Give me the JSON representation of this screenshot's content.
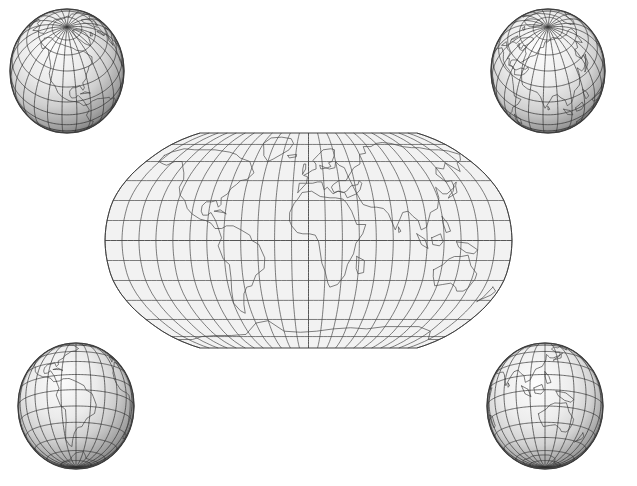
{
  "figure": {
    "background_color": "#ffffff",
    "width": 637,
    "height": 486
  },
  "style": {
    "graticule_color": "#3a3a3a",
    "coastline_color": "#4a4a4a",
    "outline_color": "#2e2e2e",
    "ocean_fill": "#f2f2f2",
    "globe_light": "#fbfbfb",
    "globe_mid": "#d2d2d2",
    "globe_dark": "#6e6e6e",
    "globe_edge": "#3c3c3c"
  },
  "main_map": {
    "name": "world-map-robinson",
    "projection": "Robinson",
    "center_longitude": 0,
    "graticule_interval_degrees": 15,
    "longitude_range": [
      -180,
      180
    ],
    "latitude_range": [
      -90,
      90
    ],
    "meridian_count": 25,
    "parallel_count": 13,
    "bounds": {
      "x": 105,
      "y": 133,
      "width": 407,
      "height": 215
    }
  },
  "globes": [
    {
      "name": "globe-north-america",
      "position": "top-left",
      "center_longitude": -100,
      "center_latitude": 45,
      "graticule_interval_degrees": 15,
      "featured_regions": "North America, Arctic, Greenland",
      "bounds": {
        "cx": 67,
        "cy": 71,
        "rx": 57,
        "ry": 62
      }
    },
    {
      "name": "globe-eurasia",
      "position": "top-right",
      "center_longitude": 80,
      "center_latitude": 45,
      "graticule_interval_degrees": 15,
      "featured_regions": "Europe, Asia, Arctic",
      "bounds": {
        "cx": 548,
        "cy": 71,
        "rx": 57,
        "ry": 62
      }
    },
    {
      "name": "globe-south-america",
      "position": "bottom-left",
      "center_longitude": -60,
      "center_latitude": -15,
      "graticule_interval_degrees": 15,
      "featured_regions": "South America, Central America",
      "bounds": {
        "cx": 76,
        "cy": 406,
        "rx": 58,
        "ry": 63
      }
    },
    {
      "name": "globe-australia",
      "position": "bottom-right",
      "center_longitude": 120,
      "center_latitude": -15,
      "graticule_interval_degrees": 15,
      "featured_regions": "Australia, Southeast Asia, Indian Ocean",
      "bounds": {
        "cx": 545,
        "cy": 406,
        "rx": 58,
        "ry": 63
      }
    }
  ],
  "coastlines": {
    "note": "Simplified coastline vertex lists in [longitude, latitude] degrees.",
    "north_america": [
      [
        -168,
        65
      ],
      [
        -166,
        60
      ],
      [
        -158,
        58
      ],
      [
        -153,
        57
      ],
      [
        -148,
        60
      ],
      [
        -140,
        60
      ],
      [
        -133,
        55
      ],
      [
        -128,
        51
      ],
      [
        -124,
        46
      ],
      [
        -124,
        40
      ],
      [
        -120,
        34
      ],
      [
        -114,
        30
      ],
      [
        -110,
        24
      ],
      [
        -105,
        20
      ],
      [
        -97,
        16
      ],
      [
        -92,
        15
      ],
      [
        -87,
        13
      ],
      [
        -83,
        9
      ],
      [
        -80,
        9
      ],
      [
        -83,
        15
      ],
      [
        -88,
        21
      ],
      [
        -91,
        19
      ],
      [
        -95,
        19
      ],
      [
        -97,
        22
      ],
      [
        -97,
        26
      ],
      [
        -94,
        29
      ],
      [
        -89,
        29
      ],
      [
        -85,
        30
      ],
      [
        -82,
        25
      ],
      [
        -80,
        27
      ],
      [
        -81,
        32
      ],
      [
        -76,
        35
      ],
      [
        -74,
        39
      ],
      [
        -70,
        42
      ],
      [
        -67,
        45
      ],
      [
        -61,
        46
      ],
      [
        -56,
        51
      ],
      [
        -60,
        55
      ],
      [
        -65,
        60
      ],
      [
        -78,
        63
      ],
      [
        -85,
        66
      ],
      [
        -95,
        68
      ],
      [
        -105,
        69
      ],
      [
        -115,
        70
      ],
      [
        -125,
        70
      ],
      [
        -140,
        70
      ],
      [
        -155,
        71
      ],
      [
        -165,
        68
      ],
      [
        -168,
        65
      ]
    ],
    "greenland": [
      [
        -45,
        60
      ],
      [
        -52,
        65
      ],
      [
        -55,
        70
      ],
      [
        -60,
        76
      ],
      [
        -55,
        82
      ],
      [
        -40,
        83
      ],
      [
        -25,
        81
      ],
      [
        -20,
        76
      ],
      [
        -24,
        70
      ],
      [
        -32,
        66
      ],
      [
        -40,
        62
      ],
      [
        -45,
        60
      ]
    ],
    "south_america": [
      [
        -80,
        9
      ],
      [
        -77,
        2
      ],
      [
        -80,
        -4
      ],
      [
        -76,
        -14
      ],
      [
        -71,
        -18
      ],
      [
        -71,
        -28
      ],
      [
        -73,
        -38
      ],
      [
        -75,
        -47
      ],
      [
        -71,
        -53
      ],
      [
        -67,
        -55
      ],
      [
        -65,
        -48
      ],
      [
        -62,
        -40
      ],
      [
        -58,
        -35
      ],
      [
        -53,
        -34
      ],
      [
        -48,
        -26
      ],
      [
        -40,
        -21
      ],
      [
        -39,
        -13
      ],
      [
        -44,
        -3
      ],
      [
        -50,
        0
      ],
      [
        -52,
        4
      ],
      [
        -60,
        8
      ],
      [
        -67,
        11
      ],
      [
        -73,
        11
      ],
      [
        -77,
        9
      ],
      [
        -80,
        9
      ]
    ],
    "africa": [
      [
        -17,
        15
      ],
      [
        -17,
        21
      ],
      [
        -13,
        28
      ],
      [
        -10,
        31
      ],
      [
        -6,
        36
      ],
      [
        3,
        37
      ],
      [
        11,
        33
      ],
      [
        20,
        32
      ],
      [
        25,
        32
      ],
      [
        32,
        31
      ],
      [
        35,
        28
      ],
      [
        39,
        22
      ],
      [
        43,
        12
      ],
      [
        51,
        12
      ],
      [
        48,
        5
      ],
      [
        42,
        -2
      ],
      [
        40,
        -10
      ],
      [
        35,
        -18
      ],
      [
        33,
        -26
      ],
      [
        27,
        -33
      ],
      [
        20,
        -35
      ],
      [
        18,
        -32
      ],
      [
        15,
        -23
      ],
      [
        12,
        -17
      ],
      [
        9,
        -1
      ],
      [
        6,
        4
      ],
      [
        1,
        5
      ],
      [
        -5,
        5
      ],
      [
        -10,
        6
      ],
      [
        -15,
        11
      ],
      [
        -17,
        15
      ]
    ],
    "europe": [
      [
        -10,
        36
      ],
      [
        -9,
        43
      ],
      [
        -2,
        43
      ],
      [
        -1,
        48
      ],
      [
        -5,
        49
      ],
      [
        0,
        51
      ],
      [
        4,
        53
      ],
      [
        8,
        54
      ],
      [
        8,
        58
      ],
      [
        5,
        61
      ],
      [
        12,
        66
      ],
      [
        18,
        70
      ],
      [
        28,
        71
      ],
      [
        32,
        70
      ],
      [
        30,
        65
      ],
      [
        26,
        60
      ],
      [
        22,
        59
      ],
      [
        24,
        56
      ],
      [
        20,
        55
      ],
      [
        13,
        54
      ],
      [
        12,
        57
      ],
      [
        18,
        55
      ],
      [
        22,
        54
      ],
      [
        28,
        55
      ],
      [
        30,
        60
      ],
      [
        33,
        57
      ],
      [
        38,
        55
      ],
      [
        40,
        48
      ],
      [
        37,
        45
      ],
      [
        30,
        45
      ],
      [
        28,
        44
      ],
      [
        24,
        42
      ],
      [
        22,
        40
      ],
      [
        24,
        36
      ],
      [
        28,
        37
      ],
      [
        33,
        36
      ],
      [
        36,
        37
      ],
      [
        41,
        41
      ],
      [
        48,
        42
      ],
      [
        50,
        45
      ],
      [
        52,
        43
      ],
      [
        49,
        38
      ],
      [
        45,
        35
      ],
      [
        36,
        32
      ],
      [
        34,
        36
      ],
      [
        28,
        37
      ],
      [
        23,
        35
      ],
      [
        18,
        40
      ],
      [
        15,
        38
      ],
      [
        13,
        44
      ],
      [
        9,
        44
      ],
      [
        4,
        43
      ],
      [
        -2,
        43
      ],
      [
        -10,
        36
      ]
    ],
    "asia": [
      [
        40,
        48
      ],
      [
        48,
        55
      ],
      [
        56,
        58
      ],
      [
        60,
        66
      ],
      [
        68,
        67
      ],
      [
        70,
        73
      ],
      [
        80,
        73
      ],
      [
        90,
        76
      ],
      [
        100,
        77
      ],
      [
        110,
        76
      ],
      [
        120,
        73
      ],
      [
        130,
        72
      ],
      [
        140,
        72
      ],
      [
        150,
        70
      ],
      [
        160,
        70
      ],
      [
        170,
        69
      ],
      [
        178,
        66
      ],
      [
        170,
        61
      ],
      [
        163,
        59
      ],
      [
        157,
        52
      ],
      [
        150,
        59
      ],
      [
        142,
        54
      ],
      [
        135,
        55
      ],
      [
        130,
        50
      ],
      [
        135,
        44
      ],
      [
        141,
        45
      ],
      [
        140,
        40
      ],
      [
        130,
        35
      ],
      [
        126,
        35
      ],
      [
        122,
        40
      ],
      [
        121,
        32
      ],
      [
        117,
        24
      ],
      [
        110,
        21
      ],
      [
        105,
        10
      ],
      [
        100,
        8
      ],
      [
        98,
        15
      ],
      [
        94,
        18
      ],
      [
        90,
        22
      ],
      [
        85,
        21
      ],
      [
        80,
        13
      ],
      [
        77,
        8
      ],
      [
        72,
        20
      ],
      [
        68,
        24
      ],
      [
        62,
        25
      ],
      [
        57,
        25
      ],
      [
        50,
        27
      ],
      [
        48,
        30
      ],
      [
        44,
        38
      ],
      [
        40,
        48
      ]
    ],
    "australia": [
      [
        113,
        -22
      ],
      [
        114,
        -27
      ],
      [
        118,
        -34
      ],
      [
        125,
        -33
      ],
      [
        132,
        -32
      ],
      [
        138,
        -35
      ],
      [
        141,
        -38
      ],
      [
        147,
        -38
      ],
      [
        150,
        -36
      ],
      [
        153,
        -29
      ],
      [
        153,
        -25
      ],
      [
        146,
        -19
      ],
      [
        142,
        -11
      ],
      [
        136,
        -12
      ],
      [
        130,
        -12
      ],
      [
        125,
        -14
      ],
      [
        121,
        -18
      ],
      [
        113,
        -22
      ]
    ],
    "antarctica": [
      [
        -180,
        -78
      ],
      [
        -160,
        -78
      ],
      [
        -140,
        -75
      ],
      [
        -120,
        -74
      ],
      [
        -100,
        -74
      ],
      [
        -80,
        -73
      ],
      [
        -60,
        -63
      ],
      [
        -45,
        -61
      ],
      [
        -30,
        -70
      ],
      [
        -10,
        -71
      ],
      [
        10,
        -70
      ],
      [
        30,
        -68
      ],
      [
        50,
        -67
      ],
      [
        70,
        -68
      ],
      [
        90,
        -66
      ],
      [
        110,
        -66
      ],
      [
        130,
        -66
      ],
      [
        150,
        -70
      ],
      [
        165,
        -78
      ],
      [
        180,
        -78
      ]
    ],
    "islands": {
      "madagascar": [
        [
          43,
          -12
        ],
        [
          50,
          -15
        ],
        [
          50,
          -24
        ],
        [
          45,
          -25
        ],
        [
          43,
          -21
        ],
        [
          43,
          -12
        ]
      ],
      "new_guinea": [
        [
          131,
          -1
        ],
        [
          141,
          -2
        ],
        [
          150,
          -7
        ],
        [
          147,
          -10
        ],
        [
          140,
          -9
        ],
        [
          133,
          -5
        ],
        [
          131,
          -1
        ]
      ],
      "japan": [
        [
          130,
          32
        ],
        [
          135,
          34
        ],
        [
          140,
          36
        ],
        [
          142,
          41
        ],
        [
          145,
          44
        ],
        [
          141,
          42
        ],
        [
          137,
          37
        ],
        [
          132,
          34
        ],
        [
          130,
          32
        ]
      ],
      "borneo": [
        [
          109,
          2
        ],
        [
          117,
          5
        ],
        [
          119,
          -1
        ],
        [
          116,
          -4
        ],
        [
          110,
          -3
        ],
        [
          109,
          2
        ]
      ],
      "sumatra": [
        [
          96,
          5
        ],
        [
          103,
          1
        ],
        [
          106,
          -6
        ],
        [
          100,
          -3
        ],
        [
          96,
          5
        ]
      ],
      "british_isles": [
        [
          -6,
          50
        ],
        [
          -3,
          54
        ],
        [
          -3,
          58
        ],
        [
          -5,
          58
        ],
        [
          -6,
          54
        ],
        [
          -6,
          50
        ]
      ],
      "new_zealand": [
        [
          173,
          -35
        ],
        [
          178,
          -38
        ],
        [
          176,
          -41
        ],
        [
          170,
          -44
        ],
        [
          167,
          -46
        ],
        [
          170,
          -43
        ],
        [
          173,
          -35
        ]
      ],
      "iceland": [
        [
          -24,
          65
        ],
        [
          -14,
          66
        ],
        [
          -14,
          64
        ],
        [
          -22,
          63
        ],
        [
          -24,
          65
        ]
      ],
      "cuba": [
        [
          -85,
          22
        ],
        [
          -77,
          21
        ],
        [
          -74,
          20
        ],
        [
          -80,
          23
        ],
        [
          -85,
          22
        ]
      ],
      "philippines": [
        [
          120,
          18
        ],
        [
          124,
          13
        ],
        [
          126,
          7
        ],
        [
          122,
          6
        ],
        [
          120,
          13
        ],
        [
          120,
          18
        ]
      ],
      "sri_lanka": [
        [
          80,
          10
        ],
        [
          82,
          7
        ],
        [
          80,
          6
        ],
        [
          80,
          10
        ]
      ]
    }
  }
}
